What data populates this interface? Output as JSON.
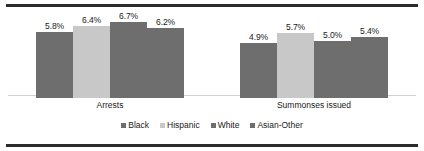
{
  "chart_data": {
    "type": "bar",
    "title": "",
    "xlabel": "",
    "ylabel": "",
    "grid": false,
    "legend_position": "bottom",
    "ylim": [
      0,
      7.6
    ],
    "categories": [
      "Arrests",
      "Summonses issued"
    ],
    "series": [
      {
        "name": "Black",
        "color": "#6e6e6e",
        "values": [
          5.8,
          4.9
        ],
        "labels": [
          "5.8%",
          "4.9%"
        ]
      },
      {
        "name": "Hispanic",
        "color": "#c8c8c8",
        "values": [
          6.4,
          5.7
        ],
        "labels": [
          "6.4%",
          "5.7%"
        ]
      },
      {
        "name": "White",
        "color": "#6e6e6e",
        "values": [
          6.7,
          5.0
        ],
        "labels": [
          "6.7%",
          "5.0%"
        ]
      },
      {
        "name": "Asian-Other",
        "color": "#6e6e6e",
        "values": [
          6.2,
          5.4
        ],
        "labels": [
          "6.2%",
          "5.4%"
        ]
      }
    ]
  },
  "legend": {
    "items": [
      {
        "label": "Black"
      },
      {
        "label": "Hispanic"
      },
      {
        "label": "White"
      },
      {
        "label": "Asian-Other"
      }
    ]
  },
  "colors": {
    "dark_bar": "#6e6e6e",
    "light_bar": "#c8c8c8",
    "rule": "#2b2b2b",
    "baseline": "#d2d2d2",
    "text": "#1a1a1a"
  }
}
